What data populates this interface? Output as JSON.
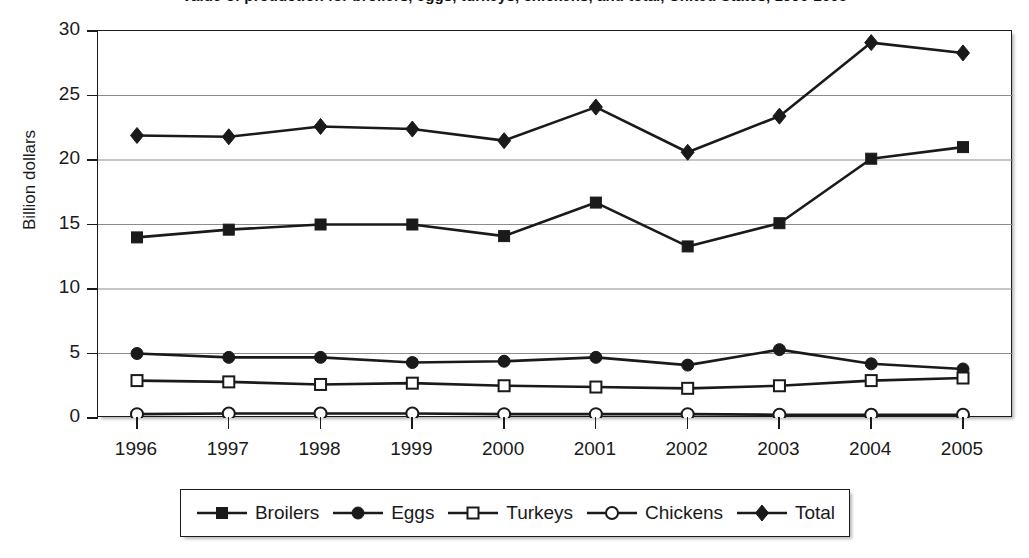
{
  "title": "Value of production for broilers, eggs, turkeys, chickens, and total, United States, 1996-2005",
  "axes": {
    "y_title": "Billion dollars",
    "y_ticks": [
      "0",
      "5",
      "10",
      "15",
      "20",
      "25",
      "30"
    ],
    "x_ticks": [
      "1996",
      "1997",
      "1998",
      "1999",
      "2000",
      "2001",
      "2002",
      "2003",
      "2004",
      "2005"
    ]
  },
  "legend": {
    "items": [
      {
        "label": "Broilers",
        "marker": "filled-square",
        "icon_name": "filled-square-marker-icon"
      },
      {
        "label": "Eggs",
        "marker": "filled-circle",
        "icon_name": "filled-circle-marker-icon"
      },
      {
        "label": "Turkeys",
        "marker": "open-square",
        "icon_name": "open-square-marker-icon"
      },
      {
        "label": "Chickens",
        "marker": "open-circle",
        "icon_name": "open-circle-marker-icon"
      },
      {
        "label": "Total",
        "marker": "filled-diamond",
        "icon_name": "filled-diamond-marker-icon"
      }
    ]
  },
  "colors": {
    "line": "#1a1a1a",
    "grid": "#8c8c8c",
    "plot_border": "#1a1a1a",
    "background": "#ffffff"
  },
  "chart_data": {
    "type": "line",
    "title": "Value of production for broilers, eggs, turkeys, chickens, and total, United States, 1996-2005",
    "xlabel": "",
    "ylabel": "Billion dollars",
    "x": [
      "1996",
      "1997",
      "1998",
      "1999",
      "2000",
      "2001",
      "2002",
      "2003",
      "2004",
      "2005"
    ],
    "categories": [
      "1996",
      "1997",
      "1998",
      "1999",
      "2000",
      "2001",
      "2002",
      "2003",
      "2004",
      "2005"
    ],
    "ylim": [
      0,
      30
    ],
    "yticks": [
      0,
      5,
      10,
      15,
      20,
      25,
      30
    ],
    "grid": true,
    "legend_position": "bottom",
    "series": [
      {
        "name": "Broilers",
        "marker": "filled-square",
        "values": [
          14.0,
          14.6,
          15.0,
          15.0,
          14.1,
          16.7,
          13.3,
          15.1,
          20.1,
          21.0
        ]
      },
      {
        "name": "Eggs",
        "marker": "filled-circle",
        "values": [
          5.0,
          4.7,
          4.7,
          4.3,
          4.4,
          4.7,
          4.1,
          5.3,
          4.2,
          3.8
        ]
      },
      {
        "name": "Turkeys",
        "marker": "open-square",
        "values": [
          2.9,
          2.8,
          2.6,
          2.7,
          2.5,
          2.4,
          2.3,
          2.5,
          2.9,
          3.1
        ]
      },
      {
        "name": "Chickens",
        "marker": "open-circle",
        "values": [
          0.3,
          0.35,
          0.35,
          0.35,
          0.3,
          0.3,
          0.3,
          0.25,
          0.25,
          0.25
        ]
      },
      {
        "name": "Total",
        "marker": "filled-diamond",
        "values": [
          21.9,
          21.8,
          22.6,
          22.4,
          21.5,
          24.1,
          20.6,
          23.4,
          29.1,
          28.3
        ]
      }
    ]
  }
}
